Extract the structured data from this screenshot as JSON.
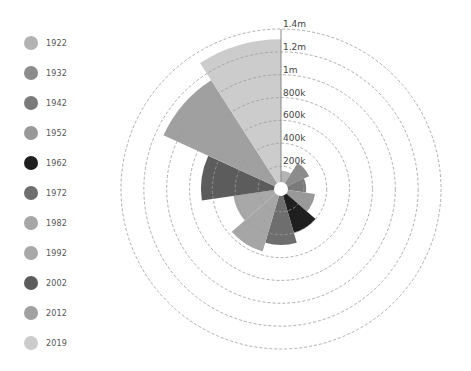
{
  "chart_data": {
    "type": "polar-area",
    "title": "",
    "center": [
      281,
      189
    ],
    "px_per_unit": 114.3,
    "inner_radius": 7,
    "axis": {
      "max": 1.4,
      "ticks": [
        0.2,
        0.4,
        0.6,
        0.8,
        1.0,
        1.2,
        1.4
      ],
      "tick_labels": [
        "200k",
        "400k",
        "600k",
        "800k",
        "1m",
        "1.2m",
        "1.4m"
      ],
      "grid": "dashed circles"
    },
    "legend_position": "left",
    "categories": [
      "1922",
      "1932",
      "1942",
      "1952",
      "1962",
      "1972",
      "1982",
      "1992",
      "2002",
      "2012",
      "2019"
    ],
    "values": [
      160000,
      270000,
      220000,
      300000,
      400000,
      490000,
      570000,
      420000,
      700000,
      1130000,
      1310000
    ],
    "colors": [
      "#b3b3b3",
      "#8c8c8c",
      "#7a7a7a",
      "#999999",
      "#1f1f1f",
      "#6e6e6e",
      "#a6a6a6",
      "#a8a8a8",
      "#5c5c5c",
      "#a0a0a0",
      "#cccccc"
    ]
  },
  "legend": {
    "items": [
      {
        "label": "1922",
        "color": "#b3b3b3"
      },
      {
        "label": "1932",
        "color": "#8c8c8c"
      },
      {
        "label": "1942",
        "color": "#7a7a7a"
      },
      {
        "label": "1952",
        "color": "#999999"
      },
      {
        "label": "1962",
        "color": "#1f1f1f"
      },
      {
        "label": "1972",
        "color": "#6e6e6e"
      },
      {
        "label": "1982",
        "color": "#a6a6a6"
      },
      {
        "label": "1992",
        "color": "#a8a8a8"
      },
      {
        "label": "2002",
        "color": "#5c5c5c"
      },
      {
        "label": "2012",
        "color": "#a0a0a0"
      },
      {
        "label": "2019",
        "color": "#cccccc"
      }
    ]
  }
}
